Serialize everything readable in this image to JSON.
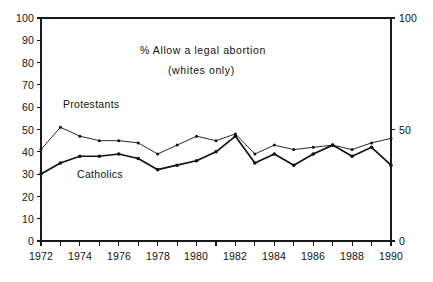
{
  "chart_data": {
    "type": "line",
    "title": "% Allow a legal abortion",
    "subtitle": "(whites only)",
    "xlabel": "",
    "ylabel": "",
    "xlim": [
      1972,
      1990
    ],
    "ylim": [
      0,
      100
    ],
    "grid": false,
    "legend_position": "inline-annotations",
    "x": [
      1972,
      1973,
      1974,
      1975,
      1976,
      1977,
      1978,
      1979,
      1980,
      1981,
      1982,
      1983,
      1984,
      1985,
      1986,
      1987,
      1988,
      1989,
      1990
    ],
    "y_ticks_left": [
      0,
      10,
      20,
      30,
      40,
      50,
      60,
      70,
      80,
      90,
      100
    ],
    "y_ticks_right": [
      0,
      50,
      100
    ],
    "x_tick_labels": [
      "1972",
      "",
      "1974",
      "",
      "1976",
      "",
      "1978",
      "",
      "1980",
      "",
      "1982",
      "",
      "1984",
      "",
      "1986",
      "",
      "1988",
      "",
      "1990"
    ],
    "x_ticks_major": [
      1972,
      1974,
      1976,
      1978,
      1980,
      1982,
      1984,
      1986,
      1988,
      1990
    ],
    "series": [
      {
        "name": "Protestants",
        "label": "Protestants",
        "color": "#111111",
        "values": [
          41,
          51,
          47,
          45,
          45,
          44,
          39,
          43,
          47,
          45,
          48,
          39,
          43,
          41,
          42,
          43,
          41,
          44,
          46
        ]
      },
      {
        "name": "Catholics",
        "label": "Catholics",
        "color": "#111111",
        "values": [
          30,
          35,
          38,
          38,
          39,
          37,
          32,
          34,
          36,
          40,
          47,
          35,
          39,
          34,
          39,
          43,
          38,
          42,
          34
        ]
      }
    ]
  },
  "annotations": {
    "protestants_label": "Protestants",
    "catholics_label": "Catholics"
  }
}
